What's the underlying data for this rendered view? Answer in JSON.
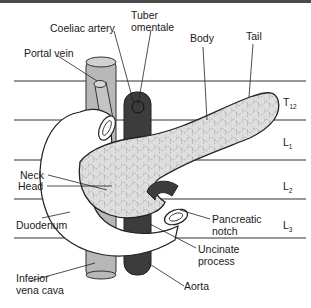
{
  "figure": {
    "labels": {
      "coeliac_artery": "Coeliac artery",
      "tuber_omentale_1": "Tuber",
      "tuber_omentale_2": "omentale",
      "portal_vein": "Portal vein",
      "body": "Body",
      "tail": "Tail",
      "neck": "Neck",
      "head": "Head",
      "duodenum": "Duodenum",
      "pancreatic_notch_1": "Pancreatic",
      "pancreatic_notch_2": "notch",
      "uncinate_process_1": "Uncinate",
      "uncinate_process_2": "process",
      "inferior_vena_cava_1": "Inferior",
      "inferior_vena_cava_2": "vena cava",
      "aorta": "Aorta"
    },
    "vertebral_levels": [
      {
        "letter": "T",
        "num": "12"
      },
      {
        "letter": "L",
        "num": "1"
      },
      {
        "letter": "L",
        "num": "2"
      },
      {
        "letter": "L",
        "num": "3"
      }
    ],
    "colors": {
      "border": "#4a4a4a",
      "ivc_portal": "#b8b8b8",
      "aorta": "#3c3c3c",
      "pancreas": "#dedede",
      "duodenum": "#ffffff"
    }
  }
}
